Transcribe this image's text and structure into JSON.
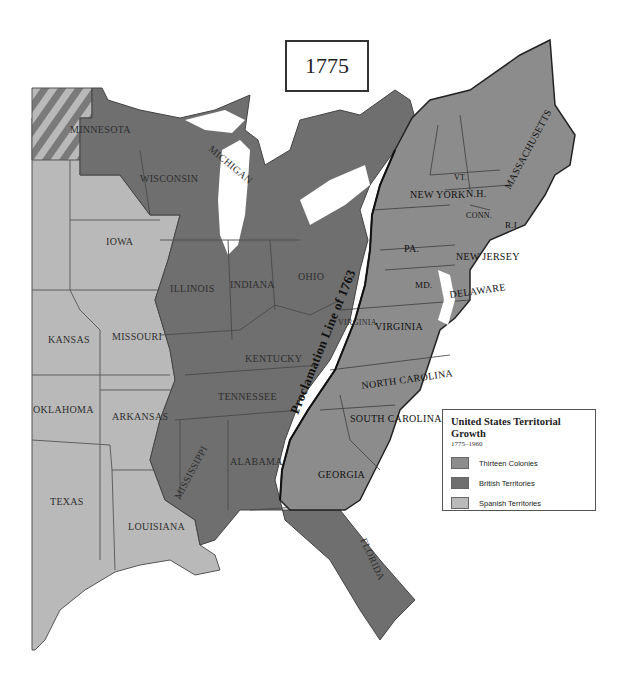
{
  "map": {
    "year": "1775",
    "colors": {
      "thirteen_colonies": "#8c8c8c",
      "british_territories": "#6f6f6f",
      "spanish_territories": "#b9b9b9",
      "border": "#3c3c3c",
      "water": "#ffffff"
    },
    "proclamation_line_label": "Proclamation Line of 1763",
    "labels": {
      "spanish": [
        "MINNESOTA",
        "IOWA",
        "KANSAS",
        "MISSOURI",
        "OKLAHOMA",
        "ARKANSAS",
        "TEXAS",
        "LOUISIANA"
      ],
      "british": [
        "WISCONSIN",
        "MICHIGAN",
        "ILLINOIS",
        "INDIANA",
        "OHIO",
        "KENTUCKY",
        "TENNESSEE",
        "MISSISSIPPI",
        "ALABAMA",
        "FLORIDA",
        "VIRGINIA"
      ],
      "colonies": [
        "VT.",
        "N.H.",
        "MASSACHUSETTS",
        "NEW YORK",
        "CONN.",
        "R.I.",
        "PA.",
        "NEW JERSEY",
        "DELAWARE",
        "MD.",
        "VIRGINIA",
        "NORTH CAROLINA",
        "SOUTH CAROLINA",
        "GEORGIA"
      ]
    }
  },
  "legend": {
    "title": "United States Territorial Growth",
    "subtitle": "1775–1960",
    "items": [
      {
        "label": "Thirteen Colonies",
        "color": "#8c8c8c"
      },
      {
        "label": "British Territories",
        "color": "#6f6f6f"
      },
      {
        "label": "Spanish Territories",
        "color": "#b9b9b9"
      }
    ]
  }
}
